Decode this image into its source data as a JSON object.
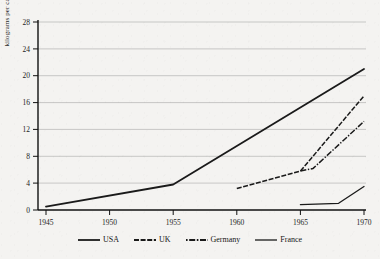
{
  "chart_data": {
    "type": "line",
    "title": "",
    "xlabel": "",
    "ylabel": "kilograms per capita",
    "xlim": [
      1945,
      1971
    ],
    "ylim": [
      0,
      28
    ],
    "xticks": [
      1945,
      1950,
      1955,
      1960,
      1965,
      1970
    ],
    "yticks": [
      0,
      4,
      8,
      12,
      16,
      20,
      24,
      28
    ],
    "grid": "horizontal",
    "legend_position": "bottom",
    "series": [
      {
        "name": "USA",
        "style": "solid",
        "color": "#1a1a1a",
        "x": [
          1945,
          1955,
          1970
        ],
        "values": [
          0.5,
          3.8,
          21.0
        ]
      },
      {
        "name": "UK",
        "style": "dashed",
        "color": "#1a1a1a",
        "x": [
          1960,
          1965,
          1970
        ],
        "values": [
          3.2,
          5.8,
          17.0
        ]
      },
      {
        "name": "Germany",
        "style": "dash-dot",
        "color": "#1a1a1a",
        "x": [
          1965,
          1966,
          1970
        ],
        "values": [
          5.8,
          6.2,
          13.2
        ]
      },
      {
        "name": "France",
        "style": "solid-thin",
        "color": "#1a1a1a",
        "x": [
          1965,
          1968,
          1970
        ],
        "values": [
          0.8,
          1.0,
          3.5
        ]
      }
    ]
  },
  "ytick_labels": [
    "0",
    "4",
    "8",
    "12",
    "16",
    "20",
    "24",
    "28"
  ],
  "xtick_labels": [
    "1945",
    "1950",
    "1955",
    "1960",
    "1965",
    "1970"
  ],
  "axis": {
    "ylabel": "kilograms per capita"
  },
  "legend": {
    "items": [
      {
        "label": "USA"
      },
      {
        "label": "UK"
      },
      {
        "label": "Germany"
      },
      {
        "label": "Germany"
      },
      {
        "label": "France"
      }
    ],
    "usa": "USA",
    "uk": "UK",
    "germany": "Germany",
    "france": "France"
  }
}
